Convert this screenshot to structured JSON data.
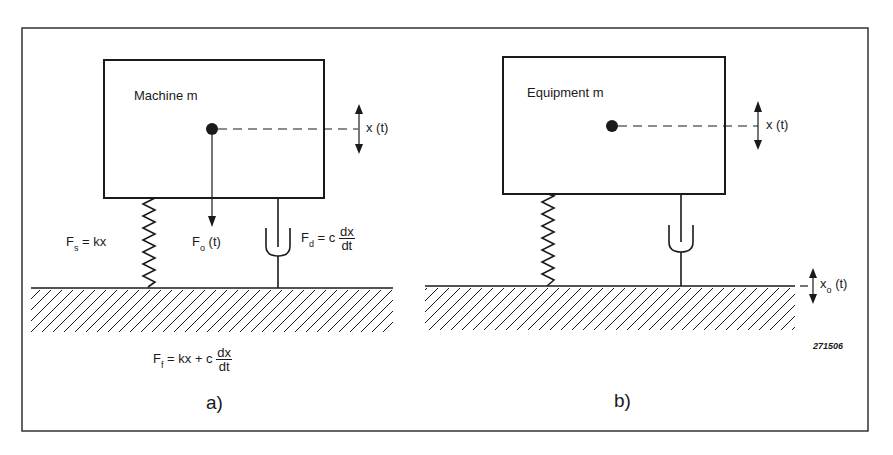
{
  "figure_id": "271506",
  "panels": [
    {
      "letter": "a)",
      "mass_label": "Machine m",
      "displacement_label": "x (t)",
      "spring_force": {
        "lhs": "F",
        "sub": "s",
        "rhs": "= kx"
      },
      "applied_force": {
        "lhs": "F",
        "sub": "o",
        "rhs": "(t)"
      },
      "damper_force": {
        "lhs": "F",
        "sub": "d",
        "rhs": "= c",
        "num": "dx",
        "den": "dt"
      },
      "foundation_force": {
        "lhs": "F",
        "sub": "f",
        "rhs": "= kx + c",
        "num": "dx",
        "den": "dt"
      }
    },
    {
      "letter": "b)",
      "mass_label": "Equipment m",
      "displacement_label": "x (t)",
      "base_motion": {
        "lhs": "x",
        "sub": "o",
        "rhs": "(t)"
      }
    }
  ],
  "colors": {
    "ink": "#1a1a1a",
    "background": "#ffffff"
  }
}
